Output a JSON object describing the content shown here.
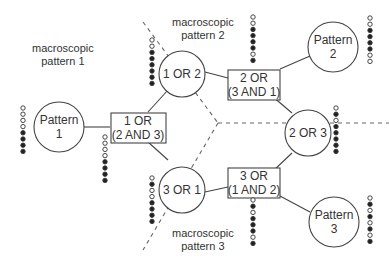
{
  "diagram": {
    "regions": [
      {
        "id": "macro1",
        "line1": "macroscopic",
        "line2": "pattern 1"
      },
      {
        "id": "macro2",
        "line1": "macroscopic",
        "line2": "pattern 2"
      },
      {
        "id": "macro3",
        "line1": "macroscopic",
        "line2": "pattern 3"
      }
    ],
    "patterns": [
      {
        "id": "p1",
        "line1": "Pattern",
        "line2": "1",
        "dots": "oooo••••"
      },
      {
        "id": "p2",
        "line1": "Pattern",
        "line2": "2",
        "dots": "oo••••oo"
      },
      {
        "id": "p3",
        "line1": "Pattern",
        "line2": "3",
        "dots": "o•o•o•o•"
      }
    ],
    "or_nodes": [
      {
        "id": "or12",
        "label": "1 OR 2",
        "dots": "oo••••••"
      },
      {
        "id": "or23",
        "label": "2 OR 3",
        "dots": "o•o•••••"
      },
      {
        "id": "or31",
        "label": "3 OR 1",
        "dots": "o•oo••••"
      }
    ],
    "boxes": [
      {
        "id": "b1",
        "line1": "1 OR",
        "line2": "(2 AND 3)",
        "dots": "oooo••••"
      },
      {
        "id": "b2",
        "line1": "2 OR",
        "line2": "(3 AND 1)",
        "dots": "oo••••o•"
      },
      {
        "id": "b3",
        "line1": "3 OR",
        "line2": "(1 AND 2)",
        "dots": "o•o•••o•"
      }
    ]
  },
  "colors": {
    "stroke": "#444444",
    "dash": "#666666",
    "text": "#333333"
  }
}
